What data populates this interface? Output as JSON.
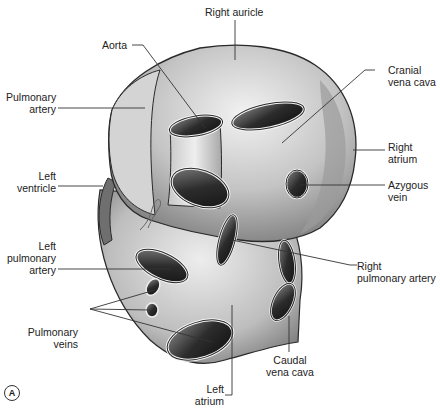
{
  "figure": {
    "panel_label": "A",
    "caption": "Figure 1.3 (A) The heart in dorsal view"
  },
  "labels": {
    "right_auricle": "Right auricle",
    "aorta": "Aorta",
    "pulmonary_artery_1": "Pulmonary",
    "pulmonary_artery_2": "artery",
    "cranial_vena_cava_1": "Cranial",
    "cranial_vena_cava_2": "vena cava",
    "right_atrium_1": "Right",
    "right_atrium_2": "atrium",
    "left_ventricle_1": "Left",
    "left_ventricle_2": "ventricle",
    "azygous_vein_1": "Azygous",
    "azygous_vein_2": "vein",
    "left_pulmonary_artery_1": "Left",
    "left_pulmonary_artery_2": "pulmonary",
    "left_pulmonary_artery_3": "artery",
    "right_pulmonary_artery_1": "Right",
    "right_pulmonary_artery_2": "pulmonary artery",
    "pulmonary_veins_1": "Pulmonary",
    "pulmonary_veins_2": "veins",
    "caudal_vena_cava_1": "Caudal",
    "caudal_vena_cava_2": "vena cava",
    "left_atrium_1": "Left",
    "left_atrium_2": "atrium"
  },
  "colors": {
    "outline": "#2a2a2a",
    "surface_light": "#e6e6e6",
    "surface_mid": "#b5b5b5",
    "surface_dark": "#6e6e6e",
    "lumen": "#1e1e1e",
    "leader_line": "#333333"
  }
}
